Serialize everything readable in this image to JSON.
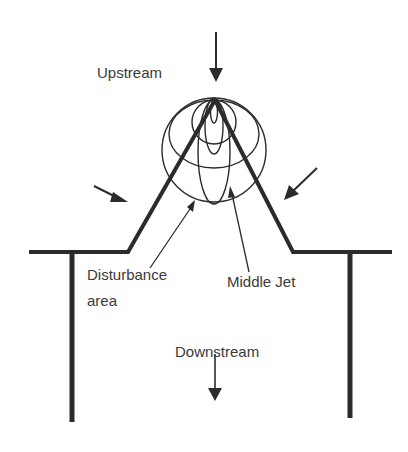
{
  "diagram": {
    "labels": {
      "upstream": "Upstream",
      "disturbance_line1": "Disturbance",
      "disturbance_line2": "area",
      "middle_jet": "Middle Jet",
      "downstream": "Downstream"
    },
    "colors": {
      "stroke": "#2b2b2b",
      "text": "#3a3a3a",
      "background": "#ffffff"
    },
    "icons": {
      "upstream_arrow": "arrow-down-icon",
      "left_inflow_arrow": "arrow-down-right-icon",
      "right_inflow_arrow": "arrow-down-left-icon",
      "downstream_arrow": "arrow-down-icon"
    }
  }
}
